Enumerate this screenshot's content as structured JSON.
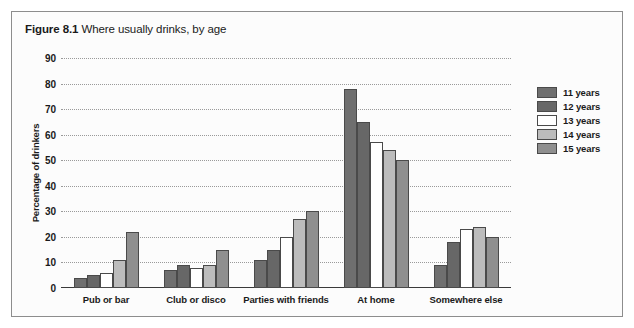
{
  "figure": {
    "number": "Figure 8.1",
    "caption": "Where usually drinks, by age"
  },
  "chart_data": {
    "type": "bar",
    "title": "Where usually drinks, by age",
    "xlabel": "",
    "ylabel": "Percentage of drinkers",
    "ylim": [
      0,
      90
    ],
    "ytick_step": 10,
    "yticks": [
      "90",
      "80",
      "70",
      "60",
      "50",
      "40",
      "30",
      "20",
      "10",
      "0"
    ],
    "grid": true,
    "legend_position": "right",
    "categories": [
      "Pub or bar",
      "Club or disco",
      "Parties with friends",
      "At home",
      "Somewhere else"
    ],
    "series": [
      {
        "name": "11 years",
        "color": "#6f6f6f",
        "values": [
          4,
          7,
          11,
          78,
          9
        ]
      },
      {
        "name": "12 years",
        "color": "#676767",
        "values": [
          5,
          9,
          15,
          65,
          18
        ]
      },
      {
        "name": "13 years",
        "color": "#ffffff",
        "values": [
          6,
          8,
          20,
          57,
          23
        ]
      },
      {
        "name": "14 years",
        "color": "#bcbcbc",
        "values": [
          11,
          9,
          27,
          54,
          24
        ]
      },
      {
        "name": "15 years",
        "color": "#8f8f8f",
        "values": [
          22,
          15,
          30,
          50,
          20
        ]
      }
    ]
  }
}
